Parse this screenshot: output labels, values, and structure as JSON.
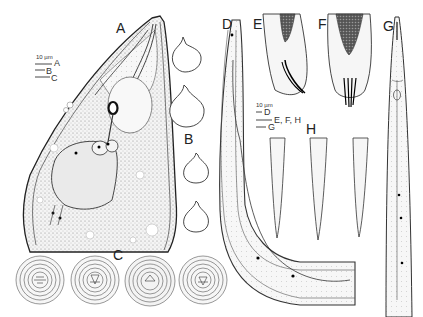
{
  "figure": {
    "panels": [
      {
        "id": "A",
        "label": "A",
        "description": "anterior body region, lateral view"
      },
      {
        "id": "B",
        "label": "B",
        "description": "spermatheca / cell shapes (4 outlines)"
      },
      {
        "id": "C",
        "label": "C",
        "description": "en face views (4 circular outlines)"
      },
      {
        "id": "D",
        "label": "D",
        "description": "curved body region"
      },
      {
        "id": "E",
        "label": "E",
        "description": "tail with spicules, lateral"
      },
      {
        "id": "F",
        "label": "F",
        "description": "tail with spicules, ventral"
      },
      {
        "id": "G",
        "label": "G",
        "description": "anterior region, elongate"
      },
      {
        "id": "H",
        "label": "H",
        "description": "female tails (3 variants)"
      }
    ],
    "scale_bar_1": {
      "unit": "10 µm",
      "entries": [
        "A",
        "B",
        "C"
      ]
    },
    "scale_bar_2": {
      "unit": "10 µm",
      "entries": [
        "D",
        "E, F, H",
        "G"
      ]
    },
    "colors": {
      "ink": "#222222",
      "stipple": "#888888",
      "background": "#ffffff"
    }
  }
}
